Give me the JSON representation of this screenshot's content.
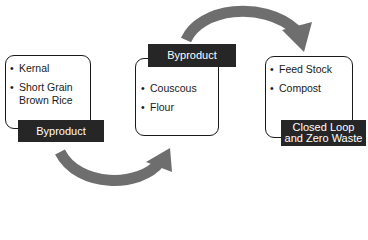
{
  "diagram": {
    "type": "cycle-flow",
    "colors": {
      "arrow": "#6e6e6e",
      "label_bg": "#262626",
      "label_text": "#ffffff",
      "border": "#1a1a1a"
    },
    "stages": [
      {
        "items": [
          "Kernal",
          "Short Grain Brown Rice"
        ],
        "label": "Byproduct"
      },
      {
        "items": [
          "Couscous",
          "Flour"
        ],
        "label": "Byproduct"
      },
      {
        "items": [
          "Feed Stock",
          "Compost"
        ],
        "label_line1": "Closed Loop",
        "label_line2": "and Zero Waste"
      }
    ],
    "arrows": [
      {
        "from": "stage-1",
        "to": "stage-2",
        "position": "bottom"
      },
      {
        "from": "stage-2",
        "to": "stage-3",
        "position": "top"
      }
    ]
  }
}
